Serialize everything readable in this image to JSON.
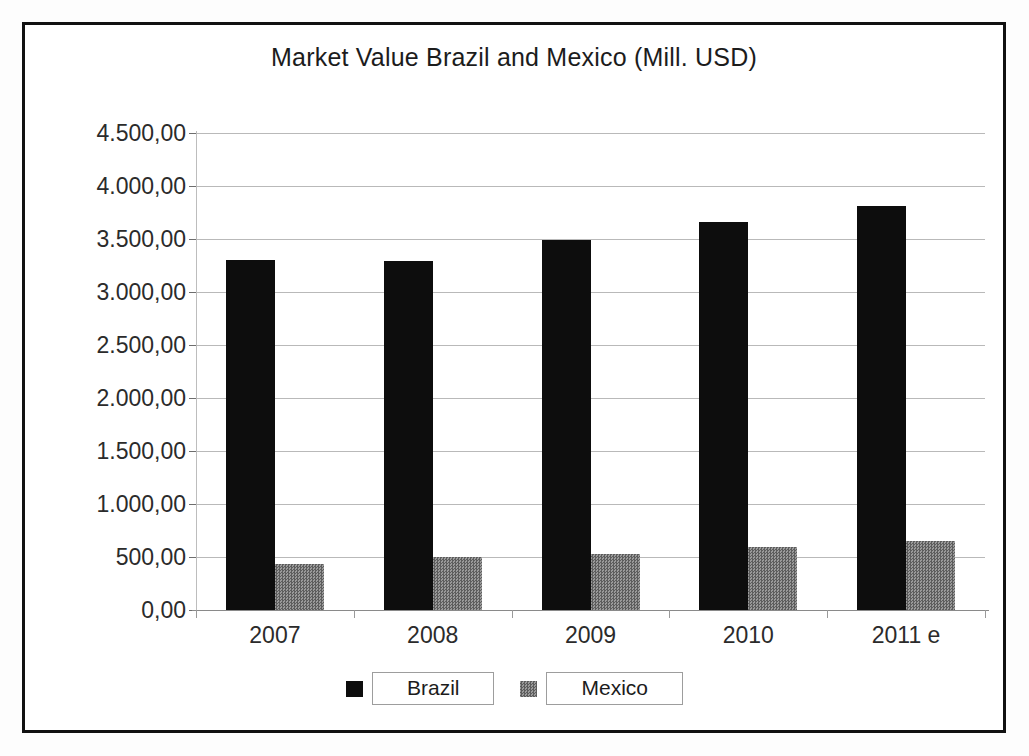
{
  "chart_data": {
    "type": "bar",
    "title": "Market Value Brazil and Mexico (Mill. USD)",
    "xlabel": "",
    "ylabel": "",
    "categories": [
      "2007",
      "2008",
      "2009",
      "2010",
      "2011 e"
    ],
    "series": [
      {
        "name": "Brazil",
        "color": "#0d0d0d",
        "values": [
          3300,
          3290,
          3490,
          3660,
          3810
        ]
      },
      {
        "name": "Mexico",
        "color": "#7b7b7b",
        "values": [
          430,
          500,
          525,
          595,
          650
        ]
      }
    ],
    "ylim": [
      0,
      4500
    ],
    "ytick_values": [
      0,
      500,
      1000,
      1500,
      2000,
      2500,
      3000,
      3500,
      4000,
      4500
    ],
    "ytick_labels": [
      "0,00",
      "500,00",
      "1.000,00",
      "1.500,00",
      "2.000,00",
      "2.500,00",
      "3.000,00",
      "3.500,00",
      "4.000,00",
      "4.500,00"
    ],
    "grid": true,
    "legend_position": "bottom",
    "legend": [
      "Brazil",
      "Mexico"
    ]
  },
  "frame": {
    "border_color": "#111111"
  }
}
